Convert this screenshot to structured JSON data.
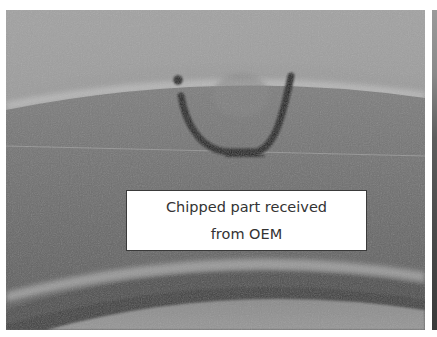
{
  "image": {
    "description": "Grayscale photo of machined ring edge with black marker U-shape circling a chip",
    "callout": {
      "lines": [
        "Chipped part received",
        "from OEM"
      ]
    },
    "colors": {
      "background": "#ffffff",
      "photo_base": "#7a7a7a",
      "marker": "#1c1c1c",
      "callout_bg": "#ffffff",
      "callout_border": "#3a3a3a",
      "callout_text": "#333333"
    }
  }
}
